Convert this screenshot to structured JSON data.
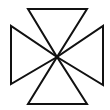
{
  "figure": {
    "stroke_color": "#111111",
    "background_color": "#ffffff",
    "arms": [
      {
        "name": "top"
      },
      {
        "name": "right"
      },
      {
        "name": "bottom"
      },
      {
        "name": "left"
      }
    ]
  }
}
